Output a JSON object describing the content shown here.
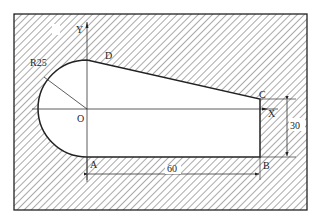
{
  "diagram": {
    "type": "machining-contour-drawing",
    "points": {
      "O": "O",
      "A": "A",
      "B": "B",
      "C": "C",
      "D": "D"
    },
    "axes": {
      "x": "X",
      "y": "Y"
    },
    "dimensions": {
      "radius": "R25",
      "length": "60",
      "height": "30"
    },
    "colors": {
      "line": "#222222",
      "hatch": "#555555",
      "background": "#ffffff"
    }
  }
}
